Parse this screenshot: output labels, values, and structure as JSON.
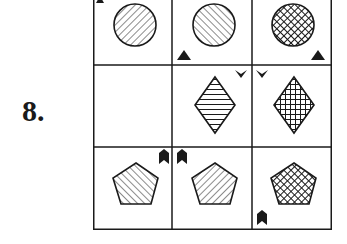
{
  "puzzle": {
    "number_label": "8.",
    "grid": {
      "rows": 3,
      "cols": 3,
      "cells": [
        [
          {
            "shape": "circle",
            "fill": "diagonal-lines-down-right",
            "marker": "triangle",
            "marker_position": "top-left"
          },
          {
            "shape": "circle",
            "fill": "diagonal-lines-up-right",
            "marker": "triangle",
            "marker_position": "bottom-left"
          },
          {
            "shape": "circle",
            "fill": "diagonal-crosshatch",
            "marker": "triangle",
            "marker_position": "bottom-right"
          }
        ],
        [
          {
            "shape": "empty",
            "fill": "none",
            "marker": "none",
            "marker_position": "none"
          },
          {
            "shape": "diamond",
            "fill": "horizontal-lines",
            "marker": "chevron-down",
            "marker_position": "top-right"
          },
          {
            "shape": "diamond",
            "fill": "grid-crosshatch",
            "marker": "chevron-down",
            "marker_position": "top-left"
          }
        ],
        [
          {
            "shape": "pentagon",
            "fill": "diagonal-lines-up-right",
            "marker": "chevron-up",
            "marker_position": "top-right"
          },
          {
            "shape": "pentagon",
            "fill": "diagonal-lines-down-right",
            "marker": "chevron-up",
            "marker_position": "top-left"
          },
          {
            "shape": "pentagon",
            "fill": "diagonal-crosshatch",
            "marker": "chevron-up",
            "marker_position": "bottom-left"
          }
        ]
      ]
    },
    "colors": {
      "line": "#1a1a1a",
      "background": "#ffffff"
    }
  }
}
